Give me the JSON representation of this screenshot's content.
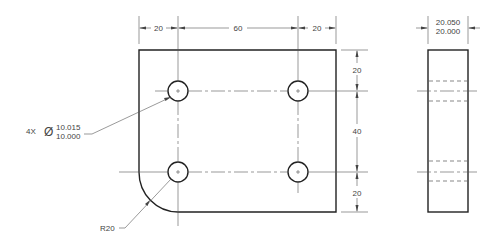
{
  "drawing": {
    "front_view": {
      "dimensions_horizontal": [
        "20",
        "60",
        "20"
      ],
      "dimensions_vertical": [
        "20",
        "40",
        "20"
      ],
      "hole_callout": {
        "quantity": "4X",
        "diameter_symbol": "Ø",
        "upper_limit": "10.015",
        "lower_limit": "10.000"
      },
      "radius_callout": "R20"
    },
    "side_view": {
      "thickness_upper": "20.050",
      "thickness_lower": "20.000"
    }
  }
}
